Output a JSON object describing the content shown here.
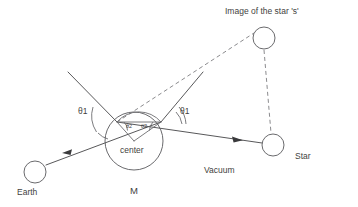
{
  "diagram": {
    "background_color": "#ffffff",
    "line_color": "#58585a",
    "dashed_color": "#8b8b8e",
    "text_color": "#3f3f41",
    "width": 358,
    "height": 207
  },
  "labels": {
    "image_star": "Image of the star 's'",
    "star": "Star",
    "earth": "Earth",
    "mass": "M",
    "center": "center",
    "vacuum": "Vacuum",
    "theta1_left": "θ1",
    "theta1_right": "θ1",
    "theta2_left": "θ2",
    "theta2_right": "θ2"
  },
  "bodies": [
    {
      "name": "image-of-star",
      "label": "Image of the star 's'",
      "cx": 264,
      "cy": 38,
      "r": 11
    },
    {
      "name": "star",
      "label": "Star",
      "cx": 273,
      "cy": 145,
      "r": 11
    },
    {
      "name": "earth",
      "label": "Earth",
      "cx": 35,
      "cy": 172,
      "r": 11
    },
    {
      "name": "lensing-mass",
      "label": "M",
      "cx": 134,
      "cy": 141,
      "r": 29
    }
  ],
  "geometry": {
    "entry_point": {
      "x": 117,
      "y": 122
    },
    "exit_point": {
      "x": 161,
      "y": 122
    },
    "bend_vertex": {
      "x": 202,
      "y": 73
    },
    "incoming_ray_start": {
      "x": 68,
      "y": 72
    },
    "center_point": {
      "x": 134,
      "y": 141
    }
  },
  "rays": [
    {
      "name": "incoming-ray-upper-left",
      "style": "solid",
      "from": "upper-left",
      "to": "entry-point"
    },
    {
      "name": "ray-to-earth",
      "style": "solid",
      "from": "exit-point",
      "to": "earth",
      "arrow": true
    },
    {
      "name": "ray-to-star",
      "style": "solid",
      "from": "entry-point",
      "to": "star",
      "arrow": true
    },
    {
      "name": "refracted-ray-upward",
      "style": "solid",
      "from": "exit-point",
      "to": "bend-vertex"
    },
    {
      "name": "apparent-ray-dashed",
      "style": "dashed",
      "from": "entry-point",
      "to": "image-of-star"
    },
    {
      "name": "image-to-star-dashed",
      "style": "dashed",
      "from": "image-of-star",
      "to": "star"
    }
  ]
}
